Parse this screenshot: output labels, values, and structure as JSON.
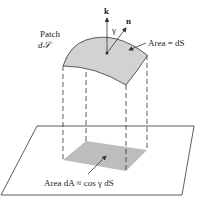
{
  "figure": {
    "labels": {
      "patch": "Patch",
      "patch_symbol": "d𝒮",
      "k": "k",
      "n": "n",
      "gamma": "γ",
      "area_ds": "Area = dS",
      "area_da": "Area dA ≈ cos γ dS"
    },
    "colors": {
      "line": "#333333",
      "patch_fill": "#d2d2d2",
      "shadow_fill": "#bdbdbd"
    }
  }
}
